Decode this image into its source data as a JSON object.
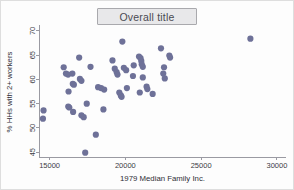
{
  "figure": {
    "title": "Overall title",
    "background_color": "#fdfdfd",
    "marker_color": "#6e7198",
    "axis_color": "#9a9aa2",
    "title_box_fill": "#e8e8ea"
  },
  "chart_data": {
    "type": "scatter",
    "title": "Overall title",
    "xlabel": "1979 Median Family Inc.",
    "ylabel": "% HHs with 2+ workers",
    "xlim": [
      14300,
      30600
    ],
    "ylim": [
      44.0,
      70.8
    ],
    "xticks": [
      15000,
      20000,
      25000,
      30000
    ],
    "yticks": [
      45,
      50,
      55,
      60,
      65,
      70
    ],
    "xtick_labels": [
      "15000",
      "20000",
      "25000",
      "30000"
    ],
    "ytick_labels": [
      "45",
      "50",
      "55",
      "60",
      "65",
      "70"
    ],
    "grid": false,
    "legend": null,
    "marker_size": 3.1,
    "n_points": 57,
    "points": [
      {
        "x": 14600,
        "y": 53.6
      },
      {
        "x": 14560,
        "y": 51.9
      },
      {
        "x": 15930,
        "y": 62.5
      },
      {
        "x": 16080,
        "y": 61.2
      },
      {
        "x": 16220,
        "y": 61.0
      },
      {
        "x": 16500,
        "y": 61.2
      },
      {
        "x": 16250,
        "y": 57.5
      },
      {
        "x": 16230,
        "y": 54.4
      },
      {
        "x": 16300,
        "y": 54.2
      },
      {
        "x": 16530,
        "y": 59.1
      },
      {
        "x": 16600,
        "y": 58.9
      },
      {
        "x": 16550,
        "y": 53.3
      },
      {
        "x": 16950,
        "y": 64.5
      },
      {
        "x": 17000,
        "y": 60.1
      },
      {
        "x": 17100,
        "y": 59.7
      },
      {
        "x": 17100,
        "y": 52.6
      },
      {
        "x": 17250,
        "y": 52.2
      },
      {
        "x": 17450,
        "y": 55.0
      },
      {
        "x": 17350,
        "y": 44.9
      },
      {
        "x": 17700,
        "y": 62.6
      },
      {
        "x": 18050,
        "y": 48.6
      },
      {
        "x": 18200,
        "y": 58.4
      },
      {
        "x": 18400,
        "y": 58.2
      },
      {
        "x": 18600,
        "y": 57.9
      },
      {
        "x": 18550,
        "y": 53.8
      },
      {
        "x": 19150,
        "y": 63.9
      },
      {
        "x": 19300,
        "y": 62.2
      },
      {
        "x": 19420,
        "y": 61.5
      },
      {
        "x": 19480,
        "y": 61.0
      },
      {
        "x": 19600,
        "y": 57.3
      },
      {
        "x": 19700,
        "y": 56.7
      },
      {
        "x": 19750,
        "y": 56.4
      },
      {
        "x": 19800,
        "y": 67.8
      },
      {
        "x": 19900,
        "y": 62.4
      },
      {
        "x": 20050,
        "y": 61.9
      },
      {
        "x": 20100,
        "y": 58.2
      },
      {
        "x": 20500,
        "y": 60.7
      },
      {
        "x": 20550,
        "y": 62.9
      },
      {
        "x": 20900,
        "y": 64.7
      },
      {
        "x": 21000,
        "y": 64.4
      },
      {
        "x": 21050,
        "y": 63.8
      },
      {
        "x": 21080,
        "y": 63.1
      },
      {
        "x": 21150,
        "y": 62.6
      },
      {
        "x": 21150,
        "y": 60.4
      },
      {
        "x": 20950,
        "y": 57.3
      },
      {
        "x": 21400,
        "y": 58.5
      },
      {
        "x": 21450,
        "y": 58.0
      },
      {
        "x": 21800,
        "y": 57.0
      },
      {
        "x": 22350,
        "y": 66.4
      },
      {
        "x": 22500,
        "y": 61.2
      },
      {
        "x": 22550,
        "y": 62.5
      },
      {
        "x": 22600,
        "y": 60.2
      },
      {
        "x": 22900,
        "y": 64.9
      },
      {
        "x": 22950,
        "y": 64.5
      },
      {
        "x": 28250,
        "y": 68.4
      }
    ]
  }
}
